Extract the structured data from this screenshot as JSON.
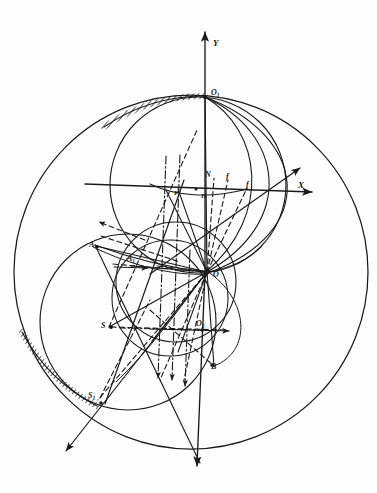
{
  "figure": {
    "background_color": "#fefefe",
    "ink_color": "#1a1a1a",
    "width": 377,
    "height": 493
  },
  "axes": {
    "y_label": "Y",
    "x_label": "X",
    "y_axis_name": "vertical-axis",
    "x_axis_name": "horizontal-axis"
  },
  "points": [
    {
      "id": "O1",
      "label": "O",
      "sub": "1",
      "x": 205,
      "y": 97,
      "name": "point-o1"
    },
    {
      "id": "O",
      "label": "O",
      "sub": "",
      "x": 205,
      "y": 272,
      "name": "point-o"
    },
    {
      "id": "O2",
      "label": "O",
      "sub": "2",
      "x": 201,
      "y": 324,
      "name": "point-o2"
    },
    {
      "id": "N",
      "label": "N",
      "sub": "",
      "x": 208,
      "y": 172,
      "name": "point-n"
    },
    {
      "id": "H",
      "label": "H",
      "sub": "",
      "x": 203,
      "y": 196,
      "name": "point-h"
    },
    {
      "id": "P",
      "label": "P",
      "sub": "",
      "x": 177,
      "y": 192,
      "name": "point-p"
    },
    {
      "id": "A",
      "label": "A",
      "sub": "",
      "x": 95,
      "y": 244,
      "name": "point-a"
    },
    {
      "id": "A1",
      "label": "A",
      "sub": "1",
      "x": 130,
      "y": 261,
      "name": "point-a1"
    },
    {
      "id": "S",
      "label": "S",
      "sub": "",
      "x": 109,
      "y": 325,
      "name": "point-s"
    },
    {
      "id": "S1",
      "label": "S",
      "sub": "1",
      "x": 93,
      "y": 396,
      "name": "point-s1"
    },
    {
      "id": "B",
      "label": "B",
      "sub": "",
      "x": 214,
      "y": 365,
      "name": "point-b"
    },
    {
      "id": "f1",
      "label": "f",
      "sub": "",
      "x": 228,
      "y": 175,
      "name": "label-f1"
    },
    {
      "id": "f2",
      "label": "f",
      "sub": "",
      "x": 248,
      "y": 183,
      "name": "label-f2"
    }
  ],
  "circles": [
    {
      "name": "outer-circle",
      "cx": 191,
      "cy": 272,
      "r": 177,
      "style": "solid"
    },
    {
      "name": "upper-circle",
      "cx": 198,
      "cy": 185,
      "r": 88,
      "style": "solid"
    },
    {
      "name": "lower-left-circle",
      "cx": 128,
      "cy": 322,
      "r": 88,
      "style": "solid"
    },
    {
      "name": "middle-circle",
      "cx": 175,
      "cy": 283,
      "r": 60,
      "style": "solid"
    },
    {
      "name": "small-circle",
      "cx": 172,
      "cy": 300,
      "r": 58,
      "style": "solid"
    }
  ],
  "arcs": [
    {
      "name": "arc-o1-to-o-inner",
      "style": "solid"
    },
    {
      "name": "arc-o1-to-o-mid",
      "style": "solid"
    },
    {
      "name": "arc-o1-to-o-outer",
      "style": "solid"
    },
    {
      "name": "hatched-arc-top",
      "style": "hatched"
    },
    {
      "name": "hatched-arc-bottom",
      "style": "hatched"
    }
  ],
  "rays": {
    "solid_count": 9,
    "dashed_count": 7,
    "dashdot_count": 2,
    "description": "Bundle of solid, dashed and dash-dot construction rays converging at point O"
  },
  "arrows": [
    {
      "name": "arrow-y-up",
      "direction": "up"
    },
    {
      "name": "arrow-y-down",
      "direction": "down"
    },
    {
      "name": "arrow-x-right",
      "direction": "right"
    },
    {
      "name": "arrow-x-diagonal",
      "direction": "up-right"
    },
    {
      "name": "arrow-dashdot-down-1",
      "direction": "down"
    },
    {
      "name": "arrow-dashdot-down-2",
      "direction": "down"
    },
    {
      "name": "arrow-dashdot-down-3",
      "direction": "down"
    },
    {
      "name": "arrow-a-upleft",
      "direction": "up-left"
    },
    {
      "name": "arrow-s1-downleft",
      "direction": "down-left"
    },
    {
      "name": "arrow-a1-right",
      "direction": "right"
    },
    {
      "name": "arrow-o2-right",
      "direction": "right"
    }
  ]
}
